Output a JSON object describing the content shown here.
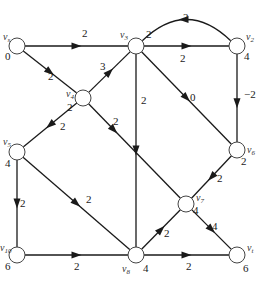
{
  "diagram": {
    "type": "directed-weighted-graph",
    "nodes": [
      {
        "id": "vs",
        "name": "v",
        "sub": "s",
        "value": "0",
        "x": 17,
        "y": 46,
        "nx": 3,
        "ny": 40,
        "vx": 5,
        "vy": 60
      },
      {
        "id": "v3",
        "name": "v",
        "sub": "3",
        "value": "2",
        "x": 136,
        "y": 46,
        "nx": 120,
        "ny": 38,
        "vx": 146,
        "vy": 38
      },
      {
        "id": "v2",
        "name": "v",
        "sub": "2",
        "value": "4",
        "x": 237,
        "y": 46,
        "nx": 246,
        "ny": 40,
        "vx": 244,
        "vy": 60
      },
      {
        "id": "v4",
        "name": "v",
        "sub": "4",
        "value": "2",
        "x": 83,
        "y": 98,
        "nx": 66,
        "ny": 97,
        "vx": 67,
        "vy": 111
      },
      {
        "id": "v5",
        "name": "v",
        "sub": "5",
        "value": "4",
        "x": 17,
        "y": 152,
        "nx": 3,
        "ny": 145,
        "vx": 5,
        "vy": 167
      },
      {
        "id": "v6",
        "name": "v",
        "sub": "6",
        "value": "2",
        "x": 237,
        "y": 150,
        "nx": 247,
        "ny": 153,
        "vx": 241,
        "vy": 165
      },
      {
        "id": "v7",
        "name": "v",
        "sub": "7",
        "value": "4",
        "x": 186,
        "y": 204,
        "nx": 196,
        "ny": 201,
        "vx": 193,
        "vy": 214
      },
      {
        "id": "v10",
        "name": "v",
        "sub": "10",
        "value": "6",
        "x": 17,
        "y": 255,
        "nx": 0,
        "ny": 251,
        "vx": 5,
        "vy": 270
      },
      {
        "id": "v8",
        "name": "v",
        "sub": "8",
        "value": "4",
        "x": 136,
        "y": 255,
        "nx": 122,
        "ny": 272,
        "vx": 143,
        "vy": 272
      },
      {
        "id": "vt",
        "name": "v",
        "sub": "t",
        "value": "6",
        "x": 237,
        "y": 255,
        "nx": 247,
        "ny": 251,
        "vx": 243,
        "vy": 272
      }
    ],
    "edges": [
      {
        "from": "vs",
        "to": "v3",
        "weight": "2",
        "lx": 82,
        "ly": 37
      },
      {
        "from": "vs",
        "to": "v4",
        "weight": "2",
        "lx": 48,
        "ly": 80
      },
      {
        "from": "v4",
        "to": "v3",
        "weight": "3",
        "lx": 100,
        "ly": 70
      },
      {
        "from": "v3",
        "to": "v2",
        "weight": "2",
        "lx": 180,
        "ly": 62
      },
      {
        "from": "v2",
        "to": "v3",
        "weight": "2",
        "lx": 183,
        "ly": 21,
        "curved": true
      },
      {
        "from": "v3",
        "to": "v8",
        "weight": "2",
        "lx": 141,
        "ly": 104
      },
      {
        "from": "v3",
        "to": "v6",
        "weight": "0",
        "lx": 190,
        "ly": 101
      },
      {
        "from": "v2",
        "to": "v6",
        "weight": "−2",
        "lx": 244,
        "ly": 98
      },
      {
        "from": "v4",
        "to": "v5",
        "weight": "2",
        "lx": 60,
        "ly": 130
      },
      {
        "from": "v4",
        "to": "v7",
        "weight": "2",
        "lx": 113,
        "ly": 125
      },
      {
        "from": "v5",
        "to": "v10",
        "weight": "2",
        "lx": 20,
        "ly": 207
      },
      {
        "from": "v5",
        "to": "v8",
        "weight": "2",
        "lx": 86,
        "ly": 203
      },
      {
        "from": "v10",
        "to": "v8",
        "weight": "2",
        "lx": 74,
        "ly": 270
      },
      {
        "from": "v6",
        "to": "v7",
        "weight": "2",
        "lx": 217,
        "ly": 182
      },
      {
        "from": "v8",
        "to": "v7",
        "weight": "2",
        "lx": 164,
        "ly": 237
      },
      {
        "from": "v7",
        "to": "vt",
        "weight": "4",
        "lx": 212,
        "ly": 230
      },
      {
        "from": "v8",
        "to": "vt",
        "weight": "2",
        "lx": 186,
        "ly": 270
      }
    ]
  }
}
